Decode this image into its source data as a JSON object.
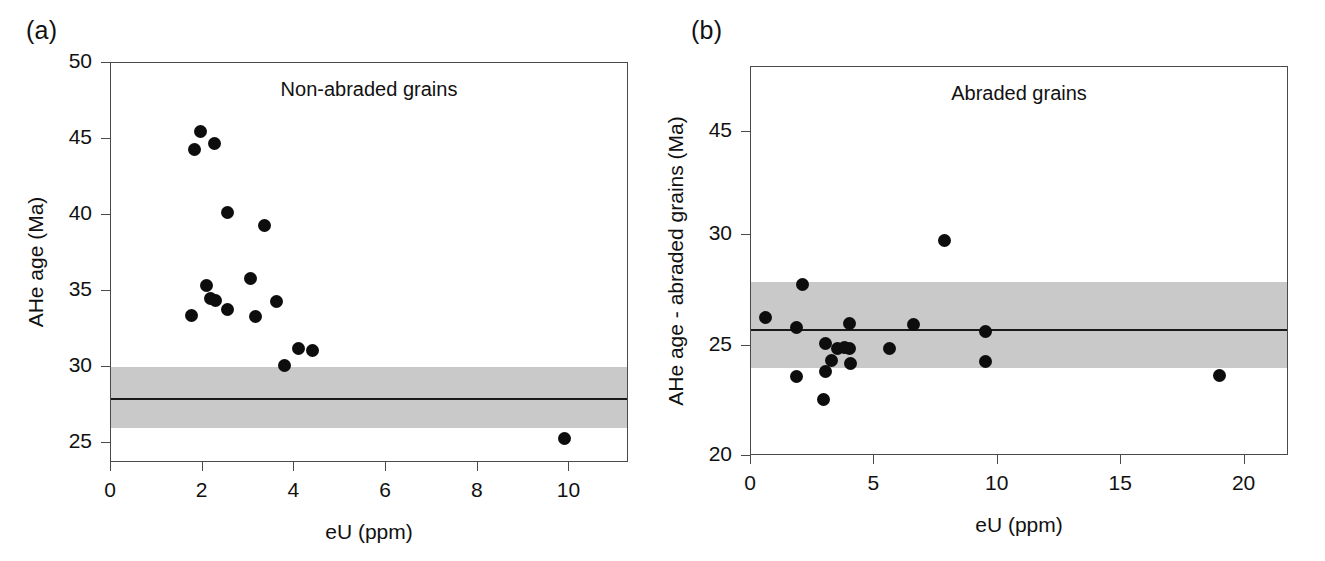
{
  "figure": {
    "background": "#ffffff",
    "marker_color": "#0d0d0d",
    "band_color": "#c9c9c9",
    "axis_color": "#4a4a4a",
    "line_color": "#1a1a1a"
  },
  "panels": [
    {
      "tag": "(a)",
      "title": "Non-abraded grains",
      "xlabel": "eU (ppm)",
      "ylabel": "AHe age (Ma)"
    },
    {
      "tag": "(b)",
      "title": "Abraded grains",
      "xlabel": "eU (ppm)",
      "ylabel": "AHe age - abraded grains (Ma)"
    }
  ],
  "chart_data": [
    {
      "type": "scatter",
      "panel": "(a)",
      "title": "Non-abraded grains",
      "xlabel": "eU (ppm)",
      "ylabel": "AHe age (Ma)",
      "xlim": [
        0,
        11.3
      ],
      "ylim": [
        23.7,
        50
      ],
      "xticks": [
        0,
        2,
        4,
        6,
        8,
        10
      ],
      "xtick_labels": [
        "0",
        "2",
        "4",
        "6",
        "8",
        "10"
      ],
      "yticks": [
        25,
        30,
        35,
        40,
        45,
        50
      ],
      "ytick_labels": [
        "25",
        "30",
        "35",
        "40",
        "45",
        "50"
      ],
      "y_axis_scale": "linear",
      "grid": false,
      "legend": "none",
      "reference_line": {
        "label": "mean age",
        "value": 28.0
      },
      "shaded_band": {
        "label": "uncertainty band",
        "ymin": 26.0,
        "ymax": 30.0
      },
      "points": [
        {
          "x": 1.95,
          "y": 45.5
        },
        {
          "x": 1.82,
          "y": 44.3
        },
        {
          "x": 2.25,
          "y": 44.7
        },
        {
          "x": 2.55,
          "y": 40.2
        },
        {
          "x": 3.35,
          "y": 39.3
        },
        {
          "x": 3.05,
          "y": 35.8
        },
        {
          "x": 2.08,
          "y": 35.4
        },
        {
          "x": 2.18,
          "y": 34.5
        },
        {
          "x": 2.28,
          "y": 34.4
        },
        {
          "x": 3.62,
          "y": 34.3
        },
        {
          "x": 2.55,
          "y": 33.8
        },
        {
          "x": 1.75,
          "y": 33.4
        },
        {
          "x": 3.15,
          "y": 33.3
        },
        {
          "x": 4.1,
          "y": 31.2
        },
        {
          "x": 4.4,
          "y": 31.1
        },
        {
          "x": 3.78,
          "y": 30.1
        },
        {
          "x": 9.9,
          "y": 25.3
        }
      ]
    },
    {
      "type": "scatter",
      "panel": "(b)",
      "title": "Abraded grains",
      "xlabel": "eU (ppm)",
      "ylabel": "AHe age - abraded grains (Ma)",
      "xlim": [
        0,
        21.8
      ],
      "ylim": [
        20,
        47.9
      ],
      "xticks": [
        0,
        5,
        10,
        15,
        20
      ],
      "xtick_labels": [
        "0",
        "5",
        "10",
        "15",
        "20"
      ],
      "yticks": [
        20,
        25,
        30,
        45
      ],
      "ytick_labels": [
        "20",
        "25",
        "30",
        "45"
      ],
      "y_axis_scale": "broken-nonlinear",
      "grid": false,
      "legend": "none",
      "reference_line": {
        "label": "mean age",
        "value": 25.75
      },
      "shaded_band": {
        "label": "uncertainty band",
        "ymin": 24.0,
        "ymax": 27.9
      },
      "points": [
        {
          "x": 7.85,
          "y": 29.75
        },
        {
          "x": 2.1,
          "y": 27.75
        },
        {
          "x": 0.6,
          "y": 26.3
        },
        {
          "x": 1.85,
          "y": 25.85
        },
        {
          "x": 4.0,
          "y": 26.0
        },
        {
          "x": 6.6,
          "y": 25.95
        },
        {
          "x": 9.5,
          "y": 25.65
        },
        {
          "x": 3.0,
          "y": 25.1
        },
        {
          "x": 3.5,
          "y": 24.9
        },
        {
          "x": 3.8,
          "y": 24.95
        },
        {
          "x": 4.0,
          "y": 24.9
        },
        {
          "x": 5.6,
          "y": 24.9
        },
        {
          "x": 3.25,
          "y": 24.35
        },
        {
          "x": 4.05,
          "y": 24.2
        },
        {
          "x": 9.5,
          "y": 24.3
        },
        {
          "x": 3.0,
          "y": 23.85
        },
        {
          "x": 1.85,
          "y": 23.6
        },
        {
          "x": 19.0,
          "y": 23.65
        },
        {
          "x": 2.95,
          "y": 22.55
        }
      ]
    }
  ]
}
